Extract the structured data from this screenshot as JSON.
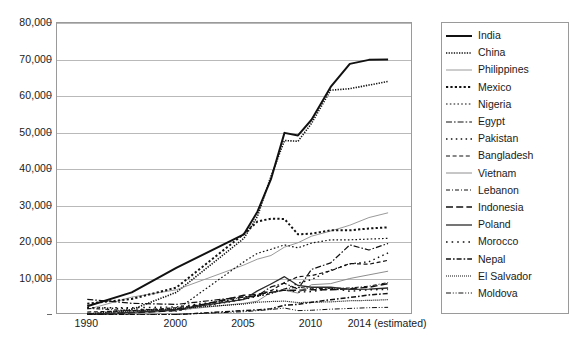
{
  "chart_data": {
    "type": "line",
    "title": "",
    "xlabel": "",
    "ylabel": "",
    "ylim": [
      0,
      80000
    ],
    "grid": true,
    "legend_position": "right",
    "y_ticks": [
      "80,000",
      "70,000",
      "60,000",
      "50,000",
      "40,000",
      "30,000",
      "20,000",
      "10,000"
    ],
    "y_tick_values": [
      80000,
      70000,
      60000,
      50000,
      40000,
      30000,
      20000,
      10000
    ],
    "x_tick_labels": [
      "1990",
      "2000",
      "2005",
      "2010",
      "2014 (estimated)"
    ],
    "x_tick_values": [
      1990,
      2000,
      2005,
      2010,
      2014
    ],
    "x": [
      1990,
      1995,
      2000,
      2005,
      2006,
      2007,
      2008,
      2009,
      2010,
      2011,
      2012,
      2013,
      2014
    ],
    "series": [
      {
        "name": "India",
        "style": "solid-bold",
        "width": 2.0,
        "values": [
          2400,
          6200,
          12900,
          22100,
          28300,
          37200,
          49900,
          49200,
          53500,
          62500,
          68800,
          69900,
          70000
        ]
      },
      {
        "name": "China",
        "style": "dotted-fine",
        "width": 1.6,
        "values": [
          200,
          1500,
          6200,
          21000,
          27000,
          38000,
          47800,
          47600,
          52500,
          61600,
          62000,
          63000,
          64000
        ]
      },
      {
        "name": "Philippines",
        "style": "solid-thin",
        "width": 1.0,
        "values": [
          1500,
          4900,
          6900,
          13700,
          15300,
          16300,
          18600,
          19800,
          21600,
          23000,
          24600,
          26700,
          28000
        ]
      },
      {
        "name": "Mexico",
        "style": "dotted-bold",
        "width": 2.0,
        "values": [
          3100,
          4400,
          7500,
          22200,
          25600,
          26400,
          26300,
          22100,
          22300,
          23200,
          23200,
          23700,
          24000
        ]
      },
      {
        "name": "Nigeria",
        "style": "dotted-med",
        "width": 1.2,
        "values": [
          100,
          800,
          1400,
          14600,
          16900,
          18000,
          19200,
          18400,
          19700,
          20600,
          20600,
          20800,
          21000
        ]
      },
      {
        "name": "Egypt",
        "style": "dash-dot",
        "width": 1.2,
        "values": [
          4300,
          3200,
          2900,
          5000,
          5300,
          7700,
          8700,
          7100,
          12500,
          14300,
          19200,
          17800,
          19600
        ]
      },
      {
        "name": "Pakistan",
        "style": "dotted-sparse",
        "width": 1.4,
        "values": [
          2000,
          1700,
          1100,
          4300,
          5100,
          6000,
          7000,
          8700,
          9700,
          12300,
          14000,
          14600,
          17000
        ]
      },
      {
        "name": "Bangladesh",
        "style": "dashed-med",
        "width": 1.2,
        "values": [
          800,
          1200,
          2000,
          4300,
          5400,
          6600,
          8900,
          10500,
          10800,
          12100,
          14100,
          13900,
          15000
        ]
      },
      {
        "name": "Vietnam",
        "style": "solid-thin2",
        "width": 1.0,
        "values": [
          100,
          300,
          1300,
          3200,
          3800,
          6200,
          6800,
          6000,
          8300,
          8600,
          10000,
          11000,
          12000
        ]
      },
      {
        "name": "Lebanon",
        "style": "dash-dot-fine",
        "width": 1.0,
        "values": [
          1800,
          1200,
          1600,
          4900,
          5200,
          5800,
          7200,
          7600,
          7200,
          7300,
          7400,
          7900,
          8900
        ]
      },
      {
        "name": "Indonesia",
        "style": "long-dash",
        "width": 1.4,
        "values": [
          200,
          600,
          1200,
          5400,
          5700,
          6200,
          6800,
          6800,
          6900,
          6900,
          7200,
          7600,
          8600
        ]
      },
      {
        "name": "Poland",
        "style": "solid-med",
        "width": 1.3,
        "values": [
          100,
          700,
          1500,
          4300,
          6600,
          8500,
          10500,
          8100,
          7600,
          7600,
          7000,
          7100,
          7400
        ]
      },
      {
        "name": "Morocco",
        "style": "dotted-wide",
        "width": 1.4,
        "values": [
          2000,
          2000,
          2200,
          4600,
          5500,
          6700,
          6900,
          6300,
          6400,
          7300,
          6500,
          6900,
          7000
        ]
      },
      {
        "name": "Nepal",
        "style": "dash-dot-bold",
        "width": 1.5,
        "values": [
          0,
          100,
          100,
          1200,
          1400,
          1700,
          2700,
          2900,
          3500,
          4200,
          4800,
          5500,
          5900
        ]
      },
      {
        "name": "El Salvador",
        "style": "dotted-dense",
        "width": 1.2,
        "values": [
          350,
          1100,
          1750,
          3000,
          3500,
          3700,
          3800,
          3400,
          3500,
          3600,
          3900,
          4000,
          4200
        ]
      },
      {
        "name": "Moldova",
        "style": "dash-dot-dot",
        "width": 1.0,
        "values": [
          0,
          50,
          150,
          900,
          1200,
          1500,
          1900,
          1200,
          1300,
          1600,
          1800,
          2000,
          2100
        ]
      }
    ]
  },
  "legend": {
    "items": [
      {
        "label": "India"
      },
      {
        "label": "China"
      },
      {
        "label": "Philippines"
      },
      {
        "label": "Mexico"
      },
      {
        "label": "Nigeria"
      },
      {
        "label": "Egypt"
      },
      {
        "label": "Pakistan"
      },
      {
        "label": "Bangladesh"
      },
      {
        "label": "Vietnam"
      },
      {
        "label": "Lebanon"
      },
      {
        "label": "Indonesia"
      },
      {
        "label": "Poland"
      },
      {
        "label": "Morocco"
      },
      {
        "label": "Nepal"
      },
      {
        "label": "El Salvador"
      },
      {
        "label": "Moldova"
      }
    ]
  },
  "caption": {
    "text": ""
  }
}
